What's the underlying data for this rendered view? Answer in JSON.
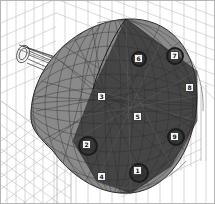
{
  "diagram": {
    "type": "wireframe-3d-model",
    "colors": {
      "background": "#ffffff",
      "border": "#b5b5b5",
      "grid": "#b8b8b8",
      "wire": "#3c3c3c",
      "dark_face": "#2a2a2a",
      "label_bg": "#f4f4f4"
    },
    "labels": [
      {
        "id": "1",
        "x": 133,
        "y": 168
      },
      {
        "id": "2",
        "x": 82,
        "y": 140
      },
      {
        "id": "3",
        "x": 97,
        "y": 92
      },
      {
        "id": "4",
        "x": 97,
        "y": 172
      },
      {
        "id": "5",
        "x": 133,
        "y": 112
      },
      {
        "id": "6",
        "x": 134,
        "y": 54
      },
      {
        "id": "7",
        "x": 170,
        "y": 51
      },
      {
        "id": "8",
        "x": 185,
        "y": 83
      },
      {
        "id": "9",
        "x": 170,
        "y": 132
      }
    ]
  }
}
